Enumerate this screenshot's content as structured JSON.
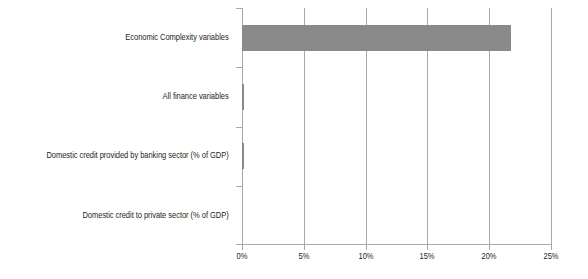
{
  "chart_data": {
    "type": "bar",
    "orientation": "horizontal",
    "title": "",
    "xlabel": "",
    "ylabel": "",
    "categories": [
      "Economic Complexity variables",
      "All finance variables",
      "Domestic credit provided by banking sector (% of GDP)",
      "Domestic credit to private sector (% of GDP)"
    ],
    "values": [
      21.8,
      0.15,
      0.15,
      0
    ],
    "value_unit": "%",
    "xlim": [
      0,
      25
    ],
    "xticks": [
      0,
      5,
      10,
      15,
      20,
      25
    ],
    "xtick_labels": [
      "0%",
      "5%",
      "10%",
      "15%",
      "20%",
      "25%"
    ],
    "grid": "vertical",
    "legend": "none",
    "bar_color": "#8a8a8a",
    "gridline_color": "#a6a8ab",
    "text_color": "#231f20"
  }
}
